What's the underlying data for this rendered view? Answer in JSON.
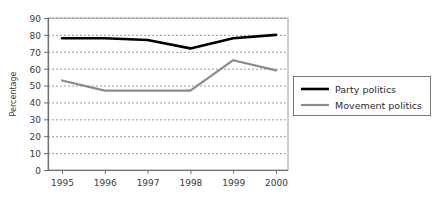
{
  "chart_data": {
    "type": "line",
    "title": "",
    "xlabel": "",
    "ylabel": "Percentage",
    "categories": [
      "1995",
      "1996",
      "1997",
      "1998",
      "1999",
      "2000"
    ],
    "x": [
      1995,
      1996,
      1997,
      1998,
      1999,
      2000
    ],
    "ylim": [
      0,
      90
    ],
    "ytick_step": 10,
    "yticks": [
      "0",
      "10",
      "20",
      "30",
      "40",
      "50",
      "60",
      "70",
      "80",
      "90"
    ],
    "grid": "horizontal-dashed",
    "legend_position": "right-outside",
    "series": [
      {
        "name": "Party politics",
        "color": "#000000",
        "width": 2.6,
        "values": [
          78,
          78,
          77,
          72,
          78,
          80
        ]
      },
      {
        "name": "Movement politics",
        "color": "#8a8a8a",
        "width": 2.2,
        "values": [
          53,
          47,
          47,
          47,
          65,
          59
        ]
      }
    ]
  },
  "axes": {
    "y_title": "Percentage"
  },
  "legend": {
    "entries": [
      {
        "label": "Party politics"
      },
      {
        "label": "Movement politics"
      }
    ]
  }
}
